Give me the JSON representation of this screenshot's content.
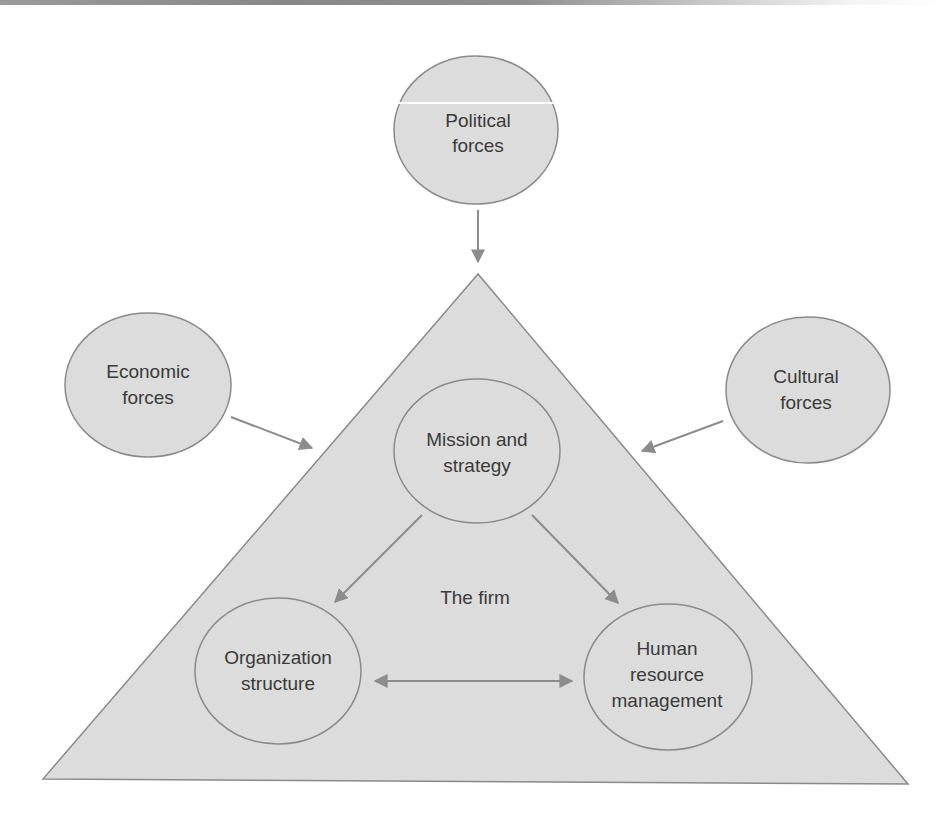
{
  "diagram": {
    "external_forces": [
      {
        "id": "political",
        "lines": [
          "Political",
          "forces"
        ]
      },
      {
        "id": "economic",
        "lines": [
          "Economic",
          "forces"
        ]
      },
      {
        "id": "cultural",
        "lines": [
          "Cultural",
          "forces"
        ]
      }
    ],
    "firm_label": "The firm",
    "internal_elements": [
      {
        "id": "mission",
        "lines": [
          "Mission and",
          "strategy"
        ]
      },
      {
        "id": "organization",
        "lines": [
          "Organization",
          "structure"
        ]
      },
      {
        "id": "hrm",
        "lines": [
          "Human",
          "resource",
          "management"
        ]
      }
    ],
    "colors": {
      "fill": "#dcdcdc",
      "stroke": "#8a8a8a",
      "arrow": "#8c8c8c",
      "text": "#3a3a3a"
    }
  }
}
